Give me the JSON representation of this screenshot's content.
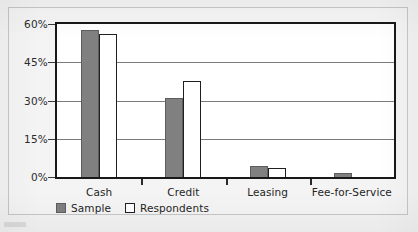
{
  "chart_data": {
    "type": "bar",
    "title": "",
    "xlabel": "",
    "ylabel": "",
    "categories": [
      "Cash",
      "Credit",
      "Leasing",
      "Fee-for-Service"
    ],
    "series": [
      {
        "name": "Sample",
        "values": [
          57.5,
          31,
          4.5,
          1.5
        ],
        "color": "#808080"
      },
      {
        "name": "Respondents",
        "values": [
          56,
          37.5,
          3.5,
          0
        ],
        "color": "#ffffff"
      }
    ],
    "ylim": [
      0,
      60
    ],
    "yticks": [
      0,
      15,
      30,
      45,
      60
    ],
    "ytick_labels": [
      "0%",
      "15%",
      "30%",
      "45%",
      "60%"
    ],
    "grid": true,
    "legend_position": "bottom-left"
  },
  "axis": {
    "y_labels": [
      "60%",
      "45%",
      "30%",
      "15%",
      "0%"
    ]
  },
  "legend": {
    "items": [
      {
        "label": "Sample",
        "style": "filled"
      },
      {
        "label": "Respondents",
        "style": "hollow"
      }
    ]
  }
}
